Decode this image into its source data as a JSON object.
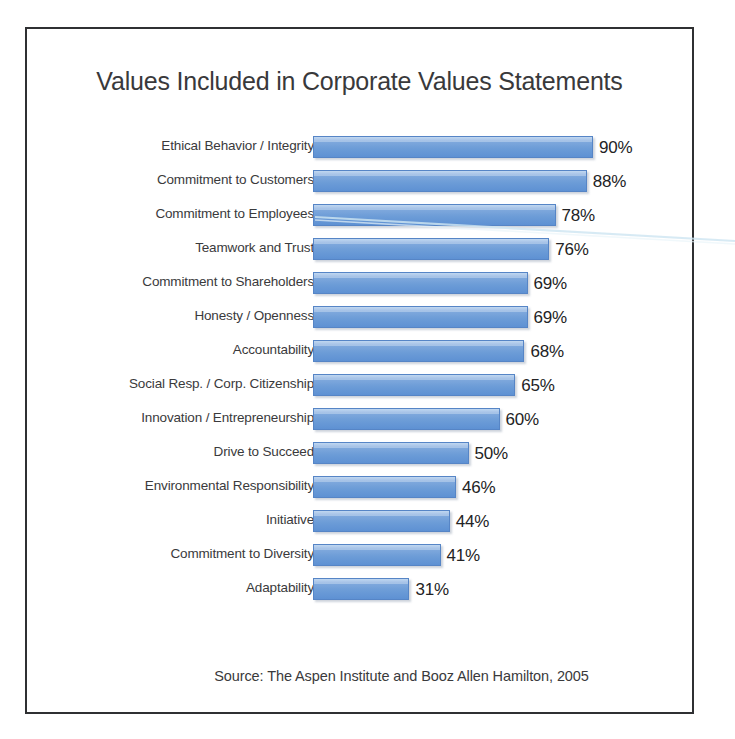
{
  "page": {
    "top_clipped_text": "",
    "background_color": "#ffffff",
    "frame_border_color": "#2f3032"
  },
  "chart_data": {
    "type": "bar",
    "orientation": "horizontal",
    "title": "Values Included in Corporate Values Statements",
    "xlabel": "",
    "ylabel": "",
    "xlim": [
      0,
      100
    ],
    "grid": false,
    "legend": null,
    "bar_color": "#6c9cd7",
    "value_label_suffix": "%",
    "source_note": "Source:  The Aspen Institute and Booz Allen Hamilton, 2005",
    "categories": [
      "Ethical Behavior / Integrity",
      "Commitment to Customers",
      "Commitment to Employees",
      "Teamwork and Trust",
      "Commitment to Shareholders",
      "Honesty / Openness",
      "Accountability",
      "Social Resp. / Corp. Citizenship",
      "Innovation / Entrepreneurship",
      "Drive to Succeed",
      "Environmental Responsibility",
      "Initiative",
      "Commitment to Diversity",
      "Adaptability"
    ],
    "values": [
      90,
      88,
      78,
      76,
      69,
      69,
      68,
      65,
      60,
      50,
      46,
      44,
      41,
      31
    ],
    "value_labels": [
      "90%",
      "88%",
      "78%",
      "76%",
      "69%",
      "69%",
      "68%",
      "65%",
      "60%",
      "50%",
      "46%",
      "44%",
      "41%",
      "31%"
    ]
  }
}
